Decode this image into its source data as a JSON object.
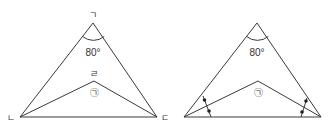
{
  "diagrams": [
    {
      "id": "left",
      "apex_label": "ㄱ",
      "base_left_label": "ㄴ",
      "base_right_label": "ㄷ",
      "inner_point_label": "ㄹ",
      "apex_angle": "80°",
      "inner_angle_label": "㉠"
    },
    {
      "id": "right",
      "apex_angle": "80°",
      "inner_angle_label": "㉠",
      "bisector_marks": "•"
    }
  ]
}
